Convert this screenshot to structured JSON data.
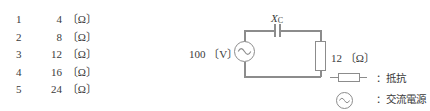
{
  "choices": {
    "items": [
      {
        "num": "1",
        "value": "4",
        "unit": "〔Ω〕"
      },
      {
        "num": "2",
        "value": "8",
        "unit": "〔Ω〕"
      },
      {
        "num": "3",
        "value": "12",
        "unit": "〔Ω〕"
      },
      {
        "num": "4",
        "value": "16",
        "unit": "〔Ω〕"
      },
      {
        "num": "5",
        "value": "24",
        "unit": "〔Ω〕"
      }
    ]
  },
  "circuit": {
    "source_label": "100 〔V〕",
    "capacitor_label_main": "X",
    "capacitor_label_sub": "C",
    "resistor_label": "12 〔Ω〕"
  },
  "legend": {
    "items": [
      {
        "symbol": "resistor-symbol",
        "text": "：抵抗"
      },
      {
        "symbol": "ac-source-symbol",
        "text": "：交流電源"
      }
    ]
  },
  "colors": {
    "line": "#8c8c8c",
    "text": "#3a3a3a",
    "background": "#ffffff"
  }
}
